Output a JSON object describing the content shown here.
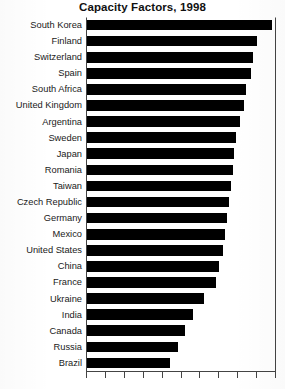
{
  "chart_data": {
    "type": "bar",
    "orientation": "horizontal",
    "title": "Capacity Factors, 1998",
    "xlabel": "",
    "ylabel": "",
    "grid": false,
    "legend": false,
    "xlim": [
      0,
      100
    ],
    "tick_count": 11,
    "bar_color": "#000000",
    "categories": [
      "South Korea",
      "Finland",
      "Switzerland",
      "Spain",
      "South Africa",
      "United Kingdom",
      "Argentina",
      "Sweden",
      "Japan",
      "Romania",
      "Taiwan",
      "Czech Republic",
      "Germany",
      "Mexico",
      "United States",
      "China",
      "France",
      "Ukraine",
      "India",
      "Canada",
      "Russia",
      "Brazil"
    ],
    "values": [
      98,
      90,
      88,
      87,
      84,
      83,
      81,
      79,
      78,
      77,
      76,
      75,
      74,
      73,
      72,
      70,
      68,
      62,
      56,
      52,
      48,
      44
    ]
  },
  "axis": {
    "ticks": [
      0,
      10,
      20,
      30,
      40,
      50,
      60,
      70,
      80,
      90,
      100
    ]
  }
}
